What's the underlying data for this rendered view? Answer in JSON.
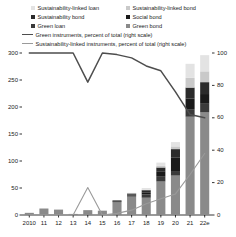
{
  "chart_data": {
    "type": "bar",
    "title": "",
    "subtitle": "",
    "xlabel": "",
    "ylabel": "",
    "y2label": "",
    "categories": [
      "2010",
      "11",
      "12",
      "13",
      "14",
      "15",
      "16",
      "17",
      "18",
      "19",
      "20",
      "21",
      "22e"
    ],
    "ylim": [
      0,
      300
    ],
    "yticks": [
      0,
      50,
      100,
      150,
      200,
      250,
      300
    ],
    "y2lim": [
      0,
      100
    ],
    "y2ticks": [
      0,
      20,
      40,
      60,
      80,
      100
    ],
    "grid": false,
    "legend_position": "top",
    "stacked": true,
    "series": [
      {
        "name": "Green bond",
        "color": "#8a8a8a",
        "type": "bar",
        "values": [
          4,
          12,
          10,
          2,
          9,
          8,
          24,
          34,
          32,
          62,
          73,
          182,
          190
        ]
      },
      {
        "name": "Green loan",
        "color": "#3a3a3a",
        "type": "bar",
        "values": [
          0,
          0,
          0,
          0,
          0,
          0,
          1,
          2,
          6,
          10,
          7,
          14,
          16
        ]
      },
      {
        "name": "Social bond",
        "color": "#1a1a1a",
        "type": "bar",
        "values": [
          0,
          0,
          0,
          0,
          0,
          0,
          1,
          2,
          4,
          9,
          26,
          20,
          18
        ]
      },
      {
        "name": "Sustainability bond",
        "color": "#2b2b2b",
        "type": "bar",
        "values": [
          0,
          0,
          0,
          0,
          0,
          0,
          1,
          2,
          4,
          7,
          16,
          20,
          22
        ]
      },
      {
        "name": "Sustainability-linked bond",
        "color": "#c9c9c9",
        "type": "bar",
        "values": [
          0,
          0,
          0,
          0,
          0,
          0,
          0,
          0,
          1,
          3,
          5,
          18,
          20
        ]
      },
      {
        "name": "Sustainability-linked loan",
        "color": "#e3e3e3",
        "type": "bar",
        "values": [
          0,
          0,
          0,
          0,
          0,
          0,
          0,
          1,
          3,
          6,
          8,
          26,
          30
        ]
      }
    ],
    "lines": [
      {
        "name": "Green instruments, percent of total (right scale)",
        "color": "#4d4d4d",
        "axis": "right",
        "values": [
          100,
          100,
          100,
          100,
          82,
          100,
          99,
          97,
          92,
          89,
          76,
          62,
          60
        ]
      },
      {
        "name": "Sustainability-linked instruments, percent of total (right scale)",
        "color": "#9a9a9a",
        "axis": "right",
        "values": [
          0,
          0,
          0,
          0,
          17,
          0,
          1,
          3,
          7,
          10,
          13,
          25,
          38
        ]
      }
    ]
  },
  "legend": {
    "items": [
      {
        "label": "Sustainability-linked loan",
        "swatch": "#e3e3e3"
      },
      {
        "label": "Sustainability-linked bond",
        "swatch": "#c9c9c9"
      },
      {
        "label": "Sustainability bond",
        "swatch": "#2b2b2b"
      },
      {
        "label": "Social bond",
        "swatch": "#1a1a1a"
      },
      {
        "label": "Green loan",
        "swatch": "#3a3a3a"
      },
      {
        "label": "Green bond",
        "swatch": "#8a8a8a"
      }
    ],
    "lines": [
      {
        "label": "Green instruments, percent of total (right scale)",
        "color": "#4d4d4d"
      },
      {
        "label": "Sustainability-linked instruments, percent of total (right scale)",
        "color": "#9a9a9a"
      }
    ]
  },
  "axes": {
    "left_ticks": [
      "300",
      "250",
      "200",
      "150",
      "100",
      "50",
      "0"
    ],
    "right_ticks": [
      "100",
      "80",
      "60",
      "40",
      "20",
      "0"
    ],
    "x_ticks": [
      "2010",
      "11",
      "12",
      "13",
      "14",
      "15",
      "16",
      "17",
      "18",
      "19",
      "20",
      "21",
      "22e"
    ]
  }
}
